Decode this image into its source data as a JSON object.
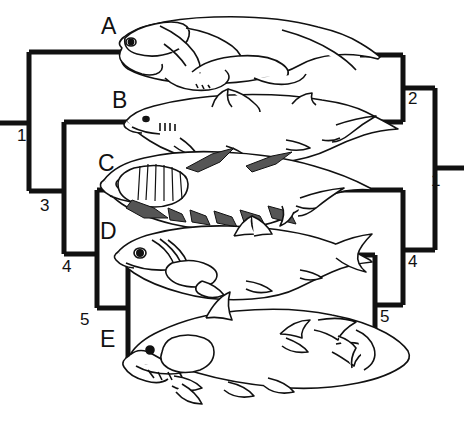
{
  "figure": {
    "kind": "cladogram-pair",
    "background": "#ffffff",
    "line_color": "#111111",
    "taxa": [
      {
        "id": "A",
        "label": "A",
        "organism": "placoderm-fish-icon",
        "row": 0
      },
      {
        "id": "B",
        "label": "B",
        "organism": "shark-fish-icon",
        "row": 1
      },
      {
        "id": "C",
        "label": "C",
        "organism": "acanthodian-fish-icon",
        "row": 2
      },
      {
        "id": "D",
        "label": "D",
        "organism": "ray-finned-fish-icon",
        "row": 3
      },
      {
        "id": "E",
        "label": "E",
        "organism": "coelacanth-fish-icon",
        "row": 4
      }
    ],
    "left_tree": {
      "name": "left-cladogram",
      "root_label": "1",
      "node_labels": [
        "1",
        "3",
        "4",
        "5"
      ],
      "topology": "(A,(B,(C,(D,E))))",
      "nodes": [
        {
          "label": "1",
          "x": 63,
          "y": 128,
          "children": [
            "A",
            "3"
          ]
        },
        {
          "label": "3",
          "x": 127,
          "y": 199,
          "children": [
            "B",
            "4"
          ]
        },
        {
          "label": "4",
          "x": 192,
          "y": 262,
          "children": [
            "C",
            "5"
          ]
        },
        {
          "label": "5",
          "x": 256,
          "y": 315,
          "children": [
            "D",
            "E"
          ]
        }
      ]
    },
    "right_tree": {
      "name": "right-cladogram",
      "root_label": "1",
      "node_labels": [
        "1",
        "2",
        "4",
        "5"
      ],
      "topology": "((A,B),(C,(D,E)))",
      "nodes": [
        {
          "label": "1",
          "x": 440,
          "y": 170,
          "children": [
            "2",
            "4"
          ]
        },
        {
          "label": "2",
          "x": 413,
          "y": 96,
          "children": [
            "A",
            "B"
          ]
        },
        {
          "label": "4",
          "x": 413,
          "y": 258,
          "children": [
            "C",
            "5"
          ]
        },
        {
          "label": "5",
          "x": 385,
          "y": 313,
          "children": [
            "D",
            "E"
          ]
        }
      ]
    },
    "caption": ""
  }
}
